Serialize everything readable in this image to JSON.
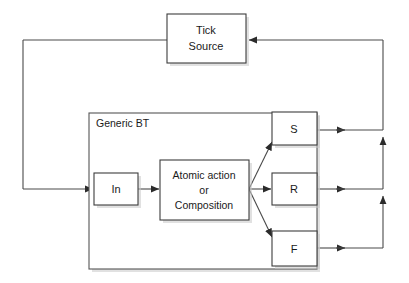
{
  "diagram": {
    "container": {
      "label": "Generic BT"
    },
    "nodes": [
      {
        "id": "tick-source",
        "label_line1": "Tick",
        "label_line2": "Source"
      },
      {
        "id": "in",
        "label": "In"
      },
      {
        "id": "atomic",
        "label_line1": "Atomic action",
        "label_line2": "or",
        "label_line3": "Composition"
      },
      {
        "id": "success",
        "label": "S"
      },
      {
        "id": "running",
        "label": "R"
      },
      {
        "id": "failure",
        "label": "F"
      }
    ],
    "edges": [
      {
        "id": "tick-to-in",
        "from": "tick-source",
        "to": "in"
      },
      {
        "id": "in-to-atomic",
        "from": "in",
        "to": "atomic"
      },
      {
        "id": "atomic-to-success",
        "from": "atomic",
        "to": "success"
      },
      {
        "id": "atomic-to-running",
        "from": "atomic",
        "to": "running"
      },
      {
        "id": "atomic-to-failure",
        "from": "atomic",
        "to": "failure"
      },
      {
        "id": "success-to-bus",
        "from": "success",
        "to": "return-bus"
      },
      {
        "id": "running-to-bus",
        "from": "running",
        "to": "return-bus"
      },
      {
        "id": "failure-to-bus",
        "from": "failure",
        "to": "return-bus"
      },
      {
        "id": "bus-to-tick-source",
        "from": "return-bus",
        "to": "tick-source"
      }
    ],
    "colors": {
      "stroke": "#4a4a4a",
      "node_stroke": "#3c3c3c",
      "background": "#ffffff",
      "text": "#1a1a1a",
      "shadow": "#c8c8c8"
    }
  }
}
